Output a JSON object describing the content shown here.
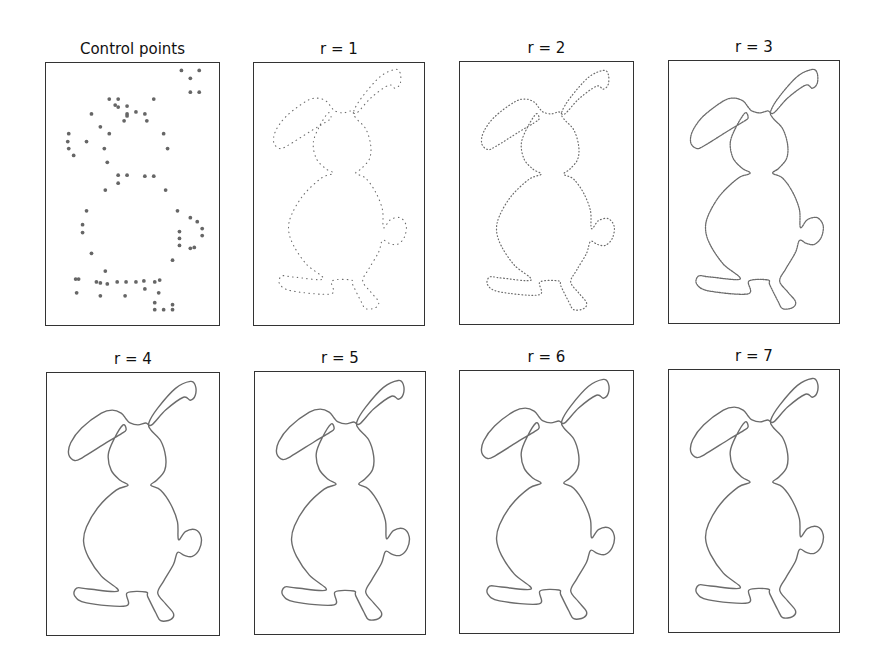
{
  "figure": {
    "stroke_color": "#6b6b6b",
    "point_color": "#666666",
    "frame_color": "#333333",
    "panels": [
      {
        "title": "Control points",
        "kind": "points",
        "x": 45,
        "y": 62,
        "w": 175,
        "h": 264
      },
      {
        "title": "r = 1",
        "kind": "curve",
        "r": 1,
        "x": 253,
        "y": 62,
        "w": 172,
        "h": 264
      },
      {
        "title": "r = 2",
        "kind": "curve",
        "r": 2,
        "x": 459,
        "y": 61,
        "w": 175,
        "h": 264
      },
      {
        "title": "r = 3",
        "kind": "curve",
        "r": 3,
        "x": 668,
        "y": 60,
        "w": 172,
        "h": 264
      },
      {
        "title": "r = 4",
        "kind": "curve",
        "r": 4,
        "x": 46,
        "y": 372,
        "w": 174,
        "h": 264
      },
      {
        "title": "r = 5",
        "kind": "curve",
        "r": 5,
        "x": 254,
        "y": 371,
        "w": 172,
        "h": 264
      },
      {
        "title": "r = 6",
        "kind": "curve",
        "r": 6,
        "x": 459,
        "y": 370,
        "w": 175,
        "h": 264
      },
      {
        "title": "r = 7",
        "kind": "curve",
        "r": 7,
        "x": 668,
        "y": 369,
        "w": 172,
        "h": 264
      }
    ]
  },
  "shape": {
    "name": "rabbit",
    "outline": [
      [
        103,
        50
      ],
      [
        112,
        35
      ],
      [
        130,
        15
      ],
      [
        145,
        8
      ],
      [
        150,
        12
      ],
      [
        150,
        22
      ],
      [
        145,
        27
      ],
      [
        138,
        24
      ],
      [
        120,
        37
      ],
      [
        106,
        52
      ],
      [
        100,
        50
      ],
      [
        92,
        52
      ],
      [
        84,
        50
      ],
      [
        80,
        46
      ],
      [
        75,
        40
      ],
      [
        66,
        37
      ],
      [
        55,
        40
      ],
      [
        35,
        55
      ],
      [
        24,
        70
      ],
      [
        22,
        82
      ],
      [
        28,
        88
      ],
      [
        36,
        85
      ],
      [
        60,
        70
      ],
      [
        75,
        61
      ],
      [
        80,
        57
      ],
      [
        77,
        52
      ],
      [
        68,
        66
      ],
      [
        62,
        82
      ],
      [
        65,
        98
      ],
      [
        74,
        108
      ],
      [
        82,
        113
      ],
      [
        70,
        118
      ],
      [
        52,
        135
      ],
      [
        40,
        155
      ],
      [
        37,
        170
      ],
      [
        42,
        186
      ],
      [
        55,
        205
      ],
      [
        72,
        220
      ],
      [
        42,
        218
      ],
      [
        30,
        217
      ],
      [
        28,
        225
      ],
      [
        40,
        232
      ],
      [
        80,
        235
      ],
      [
        81,
        222
      ],
      [
        100,
        221
      ],
      [
        102,
        226
      ],
      [
        110,
        242
      ],
      [
        115,
        250
      ],
      [
        125,
        249
      ],
      [
        128,
        243
      ],
      [
        120,
        233
      ],
      [
        112,
        222
      ],
      [
        118,
        210
      ],
      [
        128,
        193
      ],
      [
        132,
        181
      ],
      [
        139,
        184
      ],
      [
        147,
        185
      ],
      [
        154,
        178
      ],
      [
        156,
        166
      ],
      [
        150,
        158
      ],
      [
        140,
        160
      ],
      [
        133,
        168
      ],
      [
        132,
        150
      ],
      [
        125,
        132
      ],
      [
        115,
        118
      ],
      [
        105,
        113
      ],
      [
        111,
        108
      ],
      [
        119,
        98
      ],
      [
        120,
        84
      ],
      [
        115,
        68
      ],
      [
        105,
        57
      ]
    ]
  },
  "control_points": [
    [
      137,
      7
    ],
    [
      155,
      7
    ],
    [
      146,
      15
    ],
    [
      146,
      29
    ],
    [
      155,
      29
    ],
    [
      64,
      36
    ],
    [
      73,
      36
    ],
    [
      109,
      36
    ],
    [
      70,
      42
    ],
    [
      73,
      44
    ],
    [
      82,
      43
    ],
    [
      91,
      49
    ],
    [
      46,
      51
    ],
    [
      82,
      51
    ],
    [
      100,
      51
    ],
    [
      82,
      53
    ],
    [
      102,
      58
    ],
    [
      79,
      58
    ],
    [
      55,
      64
    ],
    [
      23,
      71
    ],
    [
      64,
      71
    ],
    [
      119,
      71
    ],
    [
      22,
      79
    ],
    [
      41,
      79
    ],
    [
      59,
      86
    ],
    [
      123,
      86
    ],
    [
      23,
      86
    ],
    [
      28,
      93
    ],
    [
      62,
      100
    ],
    [
      73,
      113
    ],
    [
      82,
      113
    ],
    [
      100,
      114
    ],
    [
      109,
      114
    ],
    [
      73,
      121
    ],
    [
      60,
      128
    ],
    [
      121,
      128
    ],
    [
      41,
      149
    ],
    [
      37,
      163
    ],
    [
      37,
      171
    ],
    [
      133,
      149
    ],
    [
      146,
      156
    ],
    [
      153,
      160
    ],
    [
      158,
      167
    ],
    [
      158,
      174
    ],
    [
      135,
      170
    ],
    [
      135,
      177
    ],
    [
      135,
      184
    ],
    [
      150,
      186
    ],
    [
      146,
      187
    ],
    [
      46,
      192
    ],
    [
      128,
      199
    ],
    [
      60,
      210
    ],
    [
      30,
      218
    ],
    [
      33,
      218
    ],
    [
      51,
      221
    ],
    [
      55,
      222
    ],
    [
      62,
      223
    ],
    [
      72,
      221
    ],
    [
      81,
      221
    ],
    [
      91,
      221
    ],
    [
      99,
      220
    ],
    [
      110,
      221
    ],
    [
      115,
      219
    ],
    [
      100,
      228
    ],
    [
      31,
      232
    ],
    [
      55,
      235
    ],
    [
      80,
      235
    ],
    [
      114,
      232
    ],
    [
      110,
      242
    ],
    [
      110,
      249
    ],
    [
      119,
      249
    ],
    [
      128,
      244
    ],
    [
      128,
      249
    ]
  ],
  "levels": {
    "1": {
      "dash": "0.6 4.2",
      "width": 1.1,
      "offset_x": -2,
      "offset_y": -2
    },
    "2": {
      "dash": "0.8 2.6",
      "width": 1.2,
      "offset_x": 0,
      "offset_y": 0
    },
    "3": {
      "dash": "1.5 1.0",
      "width": 1.3,
      "offset_x": 0,
      "offset_y": 0
    },
    "4": {
      "dash": "",
      "width": 1.4,
      "offset_x": 0,
      "offset_y": 0
    },
    "5": {
      "dash": "",
      "width": 1.4,
      "offset_x": 0,
      "offset_y": 0
    },
    "6": {
      "dash": "",
      "width": 1.4,
      "offset_x": 0,
      "offset_y": 0
    },
    "7": {
      "dash": "",
      "width": 1.4,
      "offset_x": 0,
      "offset_y": 0
    }
  }
}
